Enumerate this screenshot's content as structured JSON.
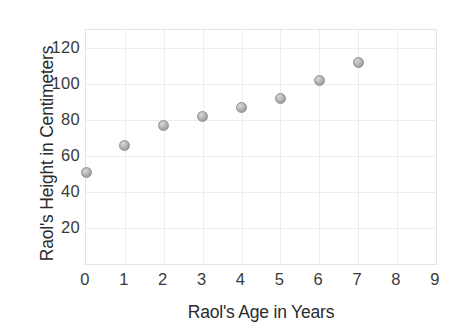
{
  "chart_data": {
    "type": "scatter",
    "title": "",
    "xlabel": "Raol's Age in Years",
    "ylabel": "Raol's Height in Centimeters",
    "x": [
      0,
      1,
      2,
      3,
      4,
      5,
      6,
      7
    ],
    "values": [
      51,
      66,
      77,
      82,
      87,
      92,
      102,
      112
    ],
    "points": [
      {
        "x": 0,
        "y": 51
      },
      {
        "x": 1,
        "y": 66
      },
      {
        "x": 2,
        "y": 77
      },
      {
        "x": 3,
        "y": 82
      },
      {
        "x": 4,
        "y": 87
      },
      {
        "x": 5,
        "y": 92
      },
      {
        "x": 6,
        "y": 102
      },
      {
        "x": 7,
        "y": 112
      }
    ],
    "xlim": [
      0,
      9
    ],
    "ylim": [
      0,
      130
    ],
    "xticks": [
      "0",
      "1",
      "2",
      "3",
      "4",
      "5",
      "6",
      "7",
      "8",
      "9"
    ],
    "yticks": [
      "20",
      "40",
      "60",
      "80",
      "100",
      "120"
    ],
    "xtick_values": [
      0,
      1,
      2,
      3,
      4,
      5,
      6,
      7,
      8,
      9
    ],
    "ytick_values": [
      20,
      40,
      60,
      80,
      100,
      120
    ],
    "grid": true,
    "legend": null,
    "marker_color": "#b0b0b0",
    "grid_color": "#ededed",
    "text_color": "#2b2b2b"
  }
}
